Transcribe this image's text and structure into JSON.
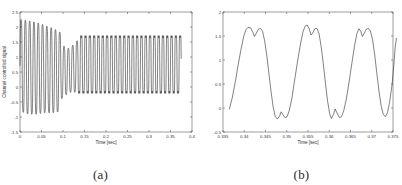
{
  "figure": {
    "background_color": "#ffffff",
    "line_color": "#1a1a1a",
    "axis_color": "#5a5a5a"
  },
  "panels": [
    {
      "caption": "(a)",
      "chart_ref": 0
    },
    {
      "caption": "(b)",
      "chart_ref": 1
    }
  ],
  "chart_data": [
    {
      "type": "line",
      "title": "",
      "xlabel": "Time [sec]",
      "ylabel": "Channel controlled signal",
      "xlim": [
        0,
        0.4
      ],
      "ylim": [
        -1.5,
        2.5
      ],
      "xticks": [
        0,
        0.05,
        0.1,
        0.15,
        0.2,
        0.25,
        0.3,
        0.35,
        0.4
      ],
      "xticklabels": [
        "0",
        "0.05",
        "0.1",
        "0.15",
        "0.2",
        "0.25",
        "0.3",
        "0.35",
        "0.4"
      ],
      "yticks": [
        -1.5,
        -1,
        -0.5,
        0,
        0.5,
        1,
        1.5,
        2,
        2.5
      ],
      "yticklabels": [
        "-1.5",
        "-1",
        "-0.5",
        "0",
        "0.5",
        "1",
        "1.5",
        "2",
        "2.5"
      ],
      "grid": false,
      "legend": null,
      "series": [
        {
          "name": "channel controlled signal",
          "description": "Oscillatory transient settling into a steady square-like limit cycle",
          "data_end_x": 0.375,
          "carrier_frequency_hz": 100,
          "segments": [
            {
              "x_start": 0.0,
              "x_end": 0.095,
              "regime": "transient",
              "envelope_high": [
                2.3,
                2.25,
                2.2,
                2.1,
                2.0,
                1.85
              ],
              "envelope_low": [
                -0.85,
                -0.95,
                -0.95,
                -0.9,
                -0.9,
                -0.85
              ]
            },
            {
              "x_start": 0.095,
              "x_end": 0.135,
              "regime": "contraction",
              "envelope_high": [
                1.5,
                1.35,
                1.3,
                1.45,
                1.6
              ],
              "envelope_low": [
                -0.45,
                -0.3,
                -0.2,
                -0.2,
                -0.2
              ]
            },
            {
              "x_start": 0.135,
              "x_end": 0.375,
              "regime": "steady-state",
              "envelope_high": [
                1.7,
                1.7,
                1.7,
                1.7,
                1.7
              ],
              "envelope_low": [
                -0.2,
                -0.2,
                -0.2,
                -0.2,
                -0.2
              ]
            }
          ]
        }
      ]
    },
    {
      "type": "line",
      "title": "",
      "xlabel": "Time [sec]",
      "ylabel": "",
      "xlim": [
        0.335,
        0.375
      ],
      "ylim": [
        -0.5,
        2
      ],
      "xticks": [
        0.335,
        0.34,
        0.345,
        0.35,
        0.355,
        0.36,
        0.365,
        0.37,
        0.375
      ],
      "xticklabels": [
        "0.335",
        "0.34",
        "0.345",
        "0.35",
        "0.355",
        "0.36",
        "0.365",
        "0.37",
        "0.375"
      ],
      "yticks": [
        -0.5,
        0,
        0.5,
        1,
        1.5,
        2
      ],
      "yticklabels": [
        "-0.5",
        "0",
        "0.5",
        "1",
        "1.5",
        "2"
      ],
      "grid": false,
      "legend": null,
      "series": [
        {
          "name": "channel controlled signal (zoom)",
          "description": "Zoom of steady-state limit cycle: flat double-peaked tops near 1.7, notched troughs near -0.2, period about 0.0115 s",
          "period_sec": 0.0115,
          "peak_value": 1.7,
          "trough_value": -0.22,
          "points": [
            [
              0.3365,
              -0.02
            ],
            [
              0.3372,
              0.22
            ],
            [
              0.3379,
              0.55
            ],
            [
              0.3386,
              0.92
            ],
            [
              0.3393,
              1.25
            ],
            [
              0.3399,
              1.5
            ],
            [
              0.3404,
              1.63
            ],
            [
              0.3409,
              1.68
            ],
            [
              0.3415,
              1.67
            ],
            [
              0.342,
              1.58
            ],
            [
              0.3424,
              1.49
            ],
            [
              0.3428,
              1.55
            ],
            [
              0.3433,
              1.64
            ],
            [
              0.3438,
              1.66
            ],
            [
              0.3443,
              1.6
            ],
            [
              0.3448,
              1.4
            ],
            [
              0.3453,
              1.1
            ],
            [
              0.3458,
              0.72
            ],
            [
              0.3463,
              0.35
            ],
            [
              0.3468,
              0.02
            ],
            [
              0.3473,
              -0.18
            ],
            [
              0.3478,
              -0.23
            ],
            [
              0.3483,
              -0.17
            ],
            [
              0.3487,
              -0.08
            ],
            [
              0.3491,
              -0.14
            ],
            [
              0.3496,
              -0.2
            ],
            [
              0.3501,
              -0.18
            ],
            [
              0.3506,
              -0.05
            ],
            [
              0.3512,
              0.2
            ],
            [
              0.3518,
              0.55
            ],
            [
              0.3525,
              0.95
            ],
            [
              0.3532,
              1.32
            ],
            [
              0.3538,
              1.58
            ],
            [
              0.3543,
              1.7
            ],
            [
              0.3548,
              1.73
            ],
            [
              0.3553,
              1.65
            ],
            [
              0.3557,
              1.52
            ],
            [
              0.3561,
              1.56
            ],
            [
              0.3566,
              1.65
            ],
            [
              0.3571,
              1.66
            ],
            [
              0.3576,
              1.55
            ],
            [
              0.3581,
              1.28
            ],
            [
              0.3586,
              0.92
            ],
            [
              0.3591,
              0.52
            ],
            [
              0.3596,
              0.15
            ],
            [
              0.3601,
              -0.12
            ],
            [
              0.3605,
              -0.22
            ],
            [
              0.361,
              -0.13
            ],
            [
              0.3614,
              -0.02
            ],
            [
              0.3619,
              -0.12
            ],
            [
              0.3624,
              -0.2
            ],
            [
              0.3629,
              -0.18
            ],
            [
              0.3634,
              -0.06
            ],
            [
              0.364,
              0.18
            ],
            [
              0.3647,
              0.56
            ],
            [
              0.3654,
              0.98
            ],
            [
              0.366,
              1.32
            ],
            [
              0.3665,
              1.55
            ],
            [
              0.367,
              1.65
            ],
            [
              0.3674,
              1.6
            ],
            [
              0.3678,
              1.49
            ],
            [
              0.3682,
              1.55
            ],
            [
              0.3687,
              1.64
            ],
            [
              0.3692,
              1.66
            ],
            [
              0.3697,
              1.6
            ],
            [
              0.3702,
              1.42
            ],
            [
              0.3707,
              1.1
            ],
            [
              0.3712,
              0.72
            ],
            [
              0.3717,
              0.35
            ],
            [
              0.3722,
              0.05
            ],
            [
              0.3727,
              -0.13
            ],
            [
              0.3732,
              -0.18
            ],
            [
              0.3737,
              -0.1
            ],
            [
              0.3742,
              0.12
            ],
            [
              0.3748,
              0.5
            ],
            [
              0.3752,
              0.9
            ],
            [
              0.3755,
              1.25
            ],
            [
              0.3758,
              1.45
            ]
          ]
        }
      ]
    }
  ]
}
